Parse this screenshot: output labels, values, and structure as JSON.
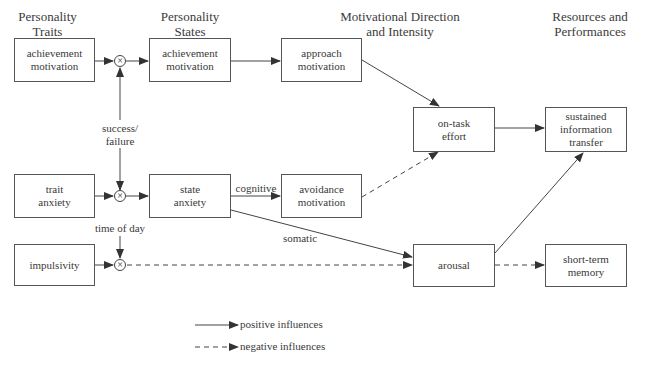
{
  "headers": {
    "traits": "Personality\nTraits",
    "states": "Personality\nStates",
    "motivation": "Motivational Direction\nand Intensity",
    "resources": "Resources and\nPerformances"
  },
  "boxes": {
    "trait_achievement": "achievement motivation",
    "state_achievement": "achievement motivation",
    "approach": "approach motivation",
    "on_task": "on-task effort",
    "sustained": "sustained information transfer",
    "trait_anxiety": "trait anxiety",
    "state_anxiety": "state anxiety",
    "avoidance": "avoidance motivation",
    "impulsivity": "impulsivity",
    "arousal": "arousal",
    "short_term": "short-term memory"
  },
  "labels": {
    "success": "success/\nfailure",
    "time_of_day": "time of day",
    "cognitive": "cognitive",
    "somatic": "somatic",
    "multiplier": "×"
  },
  "legend": {
    "positive": "positive influences",
    "negative": "negative influences"
  },
  "colors": {
    "line": "#444444",
    "text": "#3a3a3a"
  }
}
